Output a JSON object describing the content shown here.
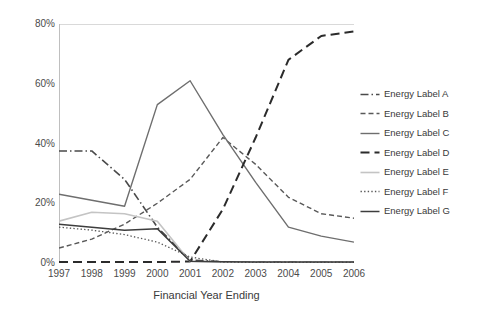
{
  "chart_data": {
    "type": "line",
    "title": "",
    "xlabel": "Financial Year Ending",
    "ylabel": "",
    "x": [
      1997,
      1998,
      1999,
      2000,
      2001,
      2002,
      2003,
      2004,
      2005,
      2006
    ],
    "xtick_labels": [
      "1997",
      "1998",
      "1999",
      "2000",
      "2001",
      "2002",
      "2003",
      "2004",
      "2005",
      "2006"
    ],
    "ytick_labels": [
      "0%",
      "20%",
      "40%",
      "60%",
      "80%"
    ],
    "ytick_values": [
      0,
      20,
      40,
      60,
      80
    ],
    "ylim": [
      0,
      80
    ],
    "grid": "horizontal-top-only",
    "legend_position": "right",
    "series": [
      {
        "name": "Energy Label A",
        "style": "dash-dot",
        "color": "#4a4a4a",
        "width": 1.6,
        "values": [
          37.5,
          37.5,
          28.0,
          12.0,
          1.0,
          0.4,
          0.3,
          0.3,
          0.2,
          0.2
        ]
      },
      {
        "name": "Energy Label B",
        "style": "dashed",
        "color": "#595959",
        "width": 1.4,
        "values": [
          5.0,
          8.0,
          13.0,
          20.0,
          28.0,
          42.0,
          33.0,
          22.0,
          16.5,
          15.0
        ]
      },
      {
        "name": "Energy Label C",
        "style": "solid",
        "color": "#6e6e6e",
        "width": 1.4,
        "values": [
          23.0,
          21.0,
          19.0,
          53.0,
          61.0,
          43.0,
          27.0,
          12.0,
          9.0,
          7.0
        ]
      },
      {
        "name": "Energy Label D",
        "style": "long-dash",
        "color": "#2b2b2b",
        "width": 2.0,
        "values": [
          0.3,
          0.3,
          0.3,
          0.3,
          0.5,
          18.0,
          42.0,
          68.0,
          76.0,
          77.5
        ]
      },
      {
        "name": "Energy Label E",
        "style": "solid",
        "color": "#c4c4c4",
        "width": 1.6,
        "values": [
          14.0,
          17.0,
          16.5,
          14.0,
          0.5,
          0.3,
          0.2,
          0.2,
          0.2,
          0.2
        ]
      },
      {
        "name": "Energy Label F",
        "style": "dotted",
        "color": "#5a5a5a",
        "width": 1.3,
        "values": [
          12.0,
          11.0,
          9.5,
          7.0,
          2.0,
          0.3,
          0.2,
          0.2,
          0.2,
          0.2
        ]
      },
      {
        "name": "Energy Label G",
        "style": "solid",
        "color": "#3d3d3d",
        "width": 1.5,
        "values": [
          13.0,
          12.0,
          11.0,
          11.5,
          0.6,
          0.4,
          0.3,
          0.3,
          0.3,
          0.3
        ]
      }
    ]
  }
}
